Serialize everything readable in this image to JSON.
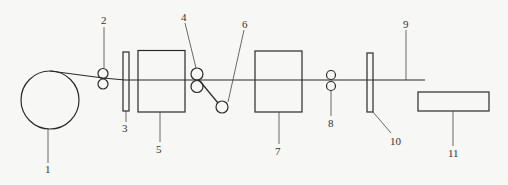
{
  "diagram": {
    "type": "process-line schematic",
    "labels": {
      "c1": "1",
      "c2": "2",
      "c3": "3",
      "c4": "4",
      "c5": "5",
      "c6": "6",
      "c7": "7",
      "c8": "8",
      "c9": "9",
      "c10": "10",
      "c11": "11"
    },
    "components": [
      {
        "id": "1",
        "shape": "large-circle"
      },
      {
        "id": "2",
        "shape": "roller-pair"
      },
      {
        "id": "3",
        "shape": "vertical-plate"
      },
      {
        "id": "4",
        "shape": "roller-pair"
      },
      {
        "id": "5",
        "shape": "box"
      },
      {
        "id": "6",
        "shape": "small-circle"
      },
      {
        "id": "7",
        "shape": "box"
      },
      {
        "id": "8",
        "shape": "roller-pair"
      },
      {
        "id": "9",
        "shape": "strand-line"
      },
      {
        "id": "10",
        "shape": "vertical-plate"
      },
      {
        "id": "11",
        "shape": "flat-box"
      }
    ],
    "colors": {
      "line": "#2a2a2a",
      "background": "#f7f7f5"
    }
  }
}
